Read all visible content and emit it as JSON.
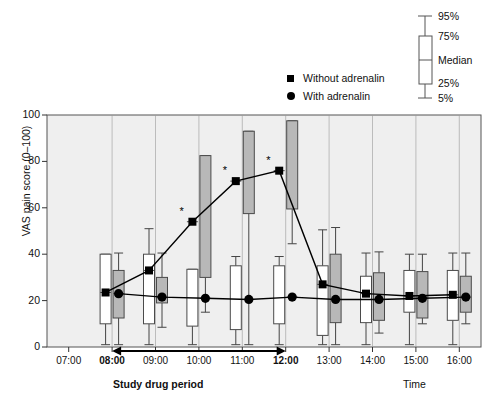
{
  "chart_data": {
    "type": "box",
    "title": "",
    "xlabel": "Time",
    "ylabel": "VAS pain score (0–100)",
    "ylim": [
      0,
      100
    ],
    "yticks": [
      0,
      20,
      40,
      60,
      80,
      100
    ],
    "xticks": [
      "07:00",
      "08:00",
      "09:00",
      "10:00",
      "11:00",
      "12:00",
      "13:00",
      "14:00",
      "15:00",
      "16:00"
    ],
    "xticks_bold": [
      "08:00",
      "12:00"
    ],
    "grid": false,
    "legend_position": "top-center",
    "series": [
      {
        "name": "Without adrenalin",
        "marker": "square",
        "box_fill": "#ffffff",
        "categories": [
          "08:00",
          "09:00",
          "10:00",
          "11:00",
          "12:00",
          "13:00",
          "14:00",
          "15:00",
          "16:00"
        ],
        "median": [
          23.5,
          33.0,
          54.0,
          71.5,
          76.0,
          27.0,
          23.0,
          22.0,
          22.5
        ],
        "q25": [
          10.0,
          10.0,
          9.0,
          7.5,
          10.0,
          5.0,
          10.5,
          15.0,
          11.5
        ],
        "q75": [
          40.0,
          40.0,
          33.5,
          35.0,
          35.0,
          35.0,
          30.5,
          33.0,
          33.0
        ],
        "p5": [
          1.0,
          1.0,
          1.0,
          1.0,
          1.0,
          1.0,
          1.0,
          1.0,
          1.0
        ],
        "p95": [
          40.0,
          51.0,
          33.5,
          39.0,
          39.0,
          50.5,
          40.5,
          40.0,
          40.5
        ],
        "significant": [
          false,
          false,
          true,
          true,
          true,
          false,
          false,
          false,
          false
        ]
      },
      {
        "name": "With adrenalin",
        "marker": "circle",
        "box_fill": "#b8b8b8",
        "categories": [
          "08:00",
          "09:00",
          "10:00",
          "11:00",
          "12:00",
          "13:00",
          "14:00",
          "15:00",
          "16:00"
        ],
        "median": [
          23.0,
          21.5,
          21.0,
          20.5,
          21.5,
          20.5,
          20.5,
          21.0,
          21.5
        ],
        "q25": [
          12.5,
          19.0,
          30.0,
          57.5,
          59.5,
          10.5,
          11.5,
          12.5,
          15.0
        ],
        "q75": [
          33.0,
          30.0,
          82.5,
          93.0,
          97.5,
          40.0,
          32.0,
          32.5,
          30.5
        ],
        "p5": [
          1.0,
          8.5,
          15.0,
          1.0,
          44.5,
          1.0,
          6.0,
          10.0,
          10.0
        ],
        "p95": [
          40.5,
          40.5,
          82.5,
          93.0,
          97.5,
          51.5,
          41.0,
          40.0,
          40.5
        ],
        "significant": [
          false,
          false,
          false,
          false,
          false,
          false,
          false,
          false,
          false
        ]
      }
    ],
    "annotations": {
      "significance_marker": "*",
      "significance_times": [
        "10:00",
        "11:00",
        "12:00"
      ],
      "period_arrow": {
        "label": "Study drug period",
        "from": "08:00",
        "to": "12:00"
      }
    },
    "boxplot_key": {
      "items": [
        "95%",
        "75%",
        "Median",
        "25%",
        "5%"
      ]
    }
  },
  "legend": {
    "entries": [
      {
        "label": "Without adrenalin",
        "marker": "square"
      },
      {
        "label": "With adrenalin",
        "marker": "circle"
      }
    ]
  },
  "axes": {
    "y_title": "VAS pain score (0–100)",
    "x_title": "Time",
    "period_label": "Study drug period"
  },
  "colors": {
    "plot_background": "#efefef",
    "box_white": "#ffffff",
    "box_grey": "#b8b8b8",
    "line": "#000000",
    "axis": "#555555"
  }
}
